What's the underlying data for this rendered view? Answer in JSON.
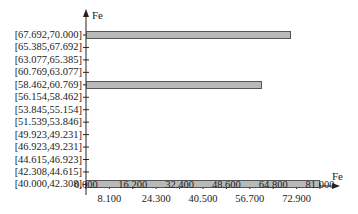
{
  "chart_data": {
    "type": "bar",
    "orientation": "horizontal",
    "title": "",
    "xlabel": "Fe",
    "ylabel": "Fe",
    "categories": [
      "[40.000,42.308]",
      "[42.308,44.615]",
      "[44.615,46.923]",
      "[46.923,49.231]",
      "[49.923,49.231]",
      "[51.539,53.846]",
      "[53.845,55.154]",
      "[56.154,58.462]",
      "[58.462,60.769]",
      "[60.769,63.077]",
      "[63.077,65.385]",
      "[65.385,67.692]",
      "[67.692,70.000]"
    ],
    "values": [
      81,
      0,
      0,
      0,
      0,
      0,
      0,
      0,
      61,
      0,
      0,
      0,
      71
    ],
    "xticks_top": [
      "0.000",
      "16.200",
      "32.400",
      "48.600",
      "64.800",
      "81.000"
    ],
    "xticks_bottom": [
      "8.100",
      "24.300",
      "40.500",
      "56.700",
      "72.900"
    ],
    "xlim": [
      0,
      81
    ],
    "grid": false,
    "legend": null
  },
  "axis": {
    "x_title": "Fe",
    "y_title": "Fe"
  }
}
